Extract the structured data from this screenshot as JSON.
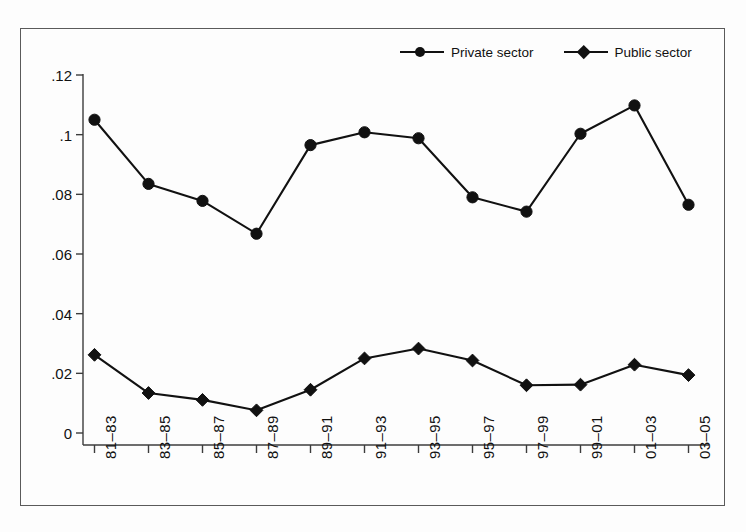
{
  "chart_data": {
    "type": "line",
    "title": "",
    "subtitle": "",
    "xlabel": "",
    "ylabel": "",
    "categories": [
      "81–83",
      "83–85",
      "85–87",
      "87–89",
      "89–91",
      "91–93",
      "93–95",
      "95–97",
      "97–99",
      "99–01",
      "01–03",
      "03–05"
    ],
    "ylim": [
      0,
      0.12
    ],
    "yticks": [
      0,
      0.02,
      0.04,
      0.06,
      0.08,
      0.1,
      0.12
    ],
    "ytick_labels": [
      "0",
      ".02",
      ".04",
      ".06",
      ".08",
      ".1",
      ".12"
    ],
    "grid": false,
    "legend_position": "top-right",
    "series": [
      {
        "name": "Private sector",
        "marker": "circle",
        "color": "#111111",
        "values": [
          0.105,
          0.0835,
          0.0778,
          0.0668,
          0.0965,
          0.1008,
          0.0988,
          0.079,
          0.0742,
          0.1003,
          0.1098,
          0.0765
        ]
      },
      {
        "name": "Public sector",
        "marker": "diamond",
        "color": "#111111",
        "values": [
          0.0262,
          0.0134,
          0.0111,
          0.0076,
          0.0145,
          0.025,
          0.0283,
          0.0243,
          0.016,
          0.0162,
          0.0229,
          0.0194
        ]
      }
    ]
  },
  "legend": {
    "entries": [
      {
        "label": "Private sector",
        "marker": "circle"
      },
      {
        "label": "Public sector",
        "marker": "diamond"
      }
    ]
  },
  "colors": {
    "ink": "#111111",
    "axis": "#3c3c3c",
    "frame": "#5a5a5a",
    "background": "#fdfdfd"
  }
}
